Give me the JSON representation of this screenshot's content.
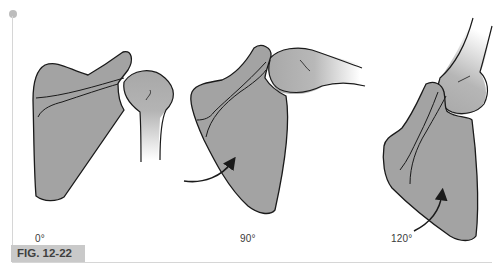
{
  "figure": {
    "label": "FIG. 12-22",
    "panels": [
      {
        "id": "panel-0",
        "angle_label": "0°",
        "has_rotation_arrow": false
      },
      {
        "id": "panel-90",
        "angle_label": "90°",
        "has_rotation_arrow": true
      },
      {
        "id": "panel-120",
        "angle_label": "120°",
        "has_rotation_arrow": true
      }
    ]
  },
  "colors": {
    "scapula_fill": "#a3a3a3",
    "humerus_fill_top": "#a8a8a8",
    "humerus_fill_bottom": "#ffffff",
    "outline": "#1a1a1a",
    "label_bg": "#c9c9c9",
    "label_text": "#3f3f3f",
    "rule": "#d6d6d6"
  }
}
